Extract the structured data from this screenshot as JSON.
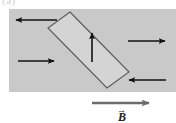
{
  "figure": {
    "partial_caption": "(a)",
    "field_label": "B",
    "field_label_vector_mark": "→",
    "colors": {
      "field_region_fill": "#c9c9c9",
      "loop_fill": "#d4d4d4",
      "loop_stroke": "#5a5a5a",
      "arrow_stroke": "#111111",
      "field_arrow_stroke": "#6b6b6b",
      "background": "#ffffff"
    },
    "field_region": {
      "x": 9,
      "y": 9,
      "width": 167,
      "height": 83
    },
    "loop": {
      "shape": "tilted-rectangle",
      "corners": [
        {
          "name": "top",
          "x": 70,
          "y": 12
        },
        {
          "name": "left",
          "x": 48,
          "y": 28
        },
        {
          "name": "bottom",
          "x": 107,
          "y": 88
        },
        {
          "name": "right",
          "x": 129,
          "y": 72
        }
      ]
    },
    "arrows": [
      {
        "name": "current-arrow-top-left",
        "direction": "left",
        "x1": 57,
        "y1": 20,
        "x2": 14,
        "y2": 20
      },
      {
        "name": "current-arrow-mid-left",
        "direction": "right",
        "x1": 18,
        "y1": 61,
        "x2": 56,
        "y2": 61
      },
      {
        "name": "current-arrow-top-right",
        "direction": "right",
        "x1": 128,
        "y1": 41,
        "x2": 167,
        "y2": 41
      },
      {
        "name": "current-arrow-bottom-right",
        "direction": "left",
        "x1": 166,
        "y1": 80,
        "x2": 127,
        "y2": 80
      },
      {
        "name": "normal-arrow-inside-loop",
        "direction": "up",
        "x1": 92,
        "y1": 62,
        "x2": 92,
        "y2": 31
      },
      {
        "name": "field-direction-arrow",
        "direction": "right",
        "x1": 92,
        "y1": 103,
        "x2": 151,
        "y2": 103
      }
    ]
  }
}
